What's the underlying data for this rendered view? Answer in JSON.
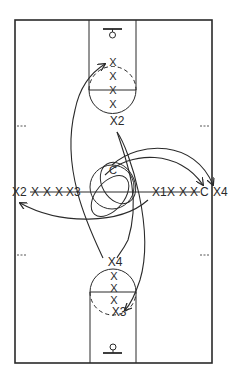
{
  "diagram": {
    "type": "basketball-court-drill",
    "colors": {
      "line": "#2a2a2a",
      "background": "#ffffff"
    },
    "court": {
      "x": 15,
      "y": 20,
      "width": 197,
      "height": 343
    },
    "top_basket": {
      "players_in_lane": [
        "X",
        "X",
        "X",
        "X"
      ],
      "label_below": "X2"
    },
    "bottom_basket": {
      "label_above": "X4",
      "players_in_lane": [
        "X",
        "X",
        "X"
      ],
      "label_bottom": "X3"
    },
    "center": {
      "label": "C"
    },
    "left_line": {
      "start_label": "X2",
      "middle": [
        "X",
        "X",
        "X"
      ],
      "end_label": "X3"
    },
    "right_line": {
      "start_label": "X1",
      "middle": [
        "X",
        "X",
        "X"
      ],
      "end_label": "C",
      "outside_label": "X4"
    }
  }
}
